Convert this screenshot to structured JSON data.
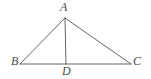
{
  "figure": {
    "name": "triangle-with-cevian",
    "background_color": "#ffffff",
    "stroke_color": "#555555",
    "label_color": "#4a4a4a",
    "stroke_width": 0.9,
    "width": 151,
    "height": 79
  },
  "points": {
    "A": {
      "label": "A",
      "x": 65,
      "y": 18
    },
    "B": {
      "label": "B",
      "x": 20,
      "y": 64
    },
    "C": {
      "label": "C",
      "x": 131,
      "y": 64
    },
    "D": {
      "label": "D",
      "x": 66,
      "y": 64
    }
  },
  "segments": [
    {
      "name": "segment-AB",
      "from": "A",
      "to": "B"
    },
    {
      "name": "segment-AC",
      "from": "A",
      "to": "C"
    },
    {
      "name": "segment-BC",
      "from": "B",
      "to": "C"
    },
    {
      "name": "segment-AD",
      "from": "A",
      "to": "D"
    }
  ]
}
